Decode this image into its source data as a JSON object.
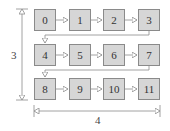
{
  "diagram": {
    "type": "memory-layout-grid",
    "rows": 3,
    "cols": 4,
    "cells": [
      {
        "label": "0"
      },
      {
        "label": "1"
      },
      {
        "label": "2"
      },
      {
        "label": "3"
      },
      {
        "label": "4"
      },
      {
        "label": "5"
      },
      {
        "label": "6"
      },
      {
        "label": "7"
      },
      {
        "label": "8"
      },
      {
        "label": "9"
      },
      {
        "label": "10"
      },
      {
        "label": "11"
      }
    ],
    "dimensions": {
      "vertical_label": "3",
      "horizontal_label": "4"
    },
    "colors": {
      "cell_fill": "#d6d6d6",
      "cell_border": "#8a8a8a",
      "line": "#8a8a8a",
      "text": "#333333"
    }
  }
}
